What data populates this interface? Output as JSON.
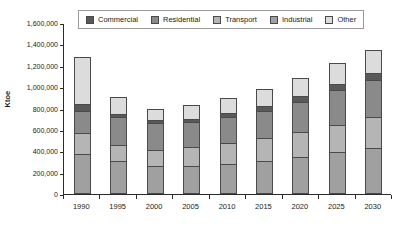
{
  "chart_data": {
    "type": "bar",
    "subtype": "stacked-bar-vertical",
    "title": "",
    "xlabel": "",
    "ylabel": "Ktoe",
    "categories": [
      "1990",
      "1995",
      "2000",
      "2005",
      "2010",
      "2015",
      "2020",
      "2025",
      "2030"
    ],
    "ylim": [
      0,
      1600000
    ],
    "ytick_step": 200000,
    "ytick_labels": [
      "0",
      "200,000",
      "400,000",
      "600,000",
      "800,000",
      "1,000,000",
      "1,200,000",
      "1,400,000",
      "1,600,000"
    ],
    "ytick_values": [
      0,
      200000,
      400000,
      600000,
      800000,
      1000000,
      1200000,
      1400000,
      1600000
    ],
    "grid": false,
    "legend_position": "top-center",
    "stack_order_bottom_to_top": [
      "Industrial",
      "Transport",
      "Residential",
      "Commercial",
      "Other"
    ],
    "series": [
      {
        "name": "Commercial",
        "color": "#595959",
        "values": [
          60000,
          20000,
          25000,
          25000,
          35000,
          45000,
          55000,
          60000,
          70000
        ]
      },
      {
        "name": "Residential",
        "color": "#8a8a8a",
        "values": [
          210000,
          270000,
          255000,
          235000,
          250000,
          255000,
          280000,
          320000,
          340000
        ]
      },
      {
        "name": "Transport",
        "color": "#b5b5b5",
        "values": [
          200000,
          145000,
          150000,
          175000,
          190000,
          215000,
          235000,
          260000,
          290000
        ]
      },
      {
        "name": "Industrial",
        "color": "#a0a0a0",
        "values": [
          370000,
          310000,
          260000,
          265000,
          285000,
          310000,
          345000,
          390000,
          435000
        ]
      },
      {
        "name": "Other",
        "color": "#dcdcdc",
        "values": [
          440000,
          160000,
          110000,
          135000,
          140000,
          155000,
          175000,
          195000,
          215000
        ]
      }
    ],
    "totals": [
      1280000,
      905000,
      830000,
      880000,
      935000,
      1025000,
      1135000,
      1270000,
      1405000
    ]
  },
  "legend": {
    "items": [
      {
        "label": "Commercial"
      },
      {
        "label": "Residential"
      },
      {
        "label": "Transport"
      },
      {
        "label": "Industrial"
      },
      {
        "label": "Other"
      }
    ]
  },
  "axes": {
    "y_title": "Ktoe"
  }
}
